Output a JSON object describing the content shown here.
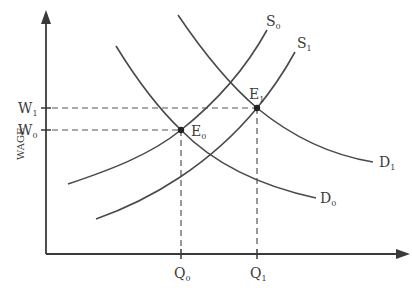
{
  "diagram": {
    "type": "labor-market supply-demand",
    "y_axis_label": "WAGE",
    "wage_levels": [
      {
        "label": "W",
        "sub": "1"
      },
      {
        "label": "W",
        "sub": "0"
      }
    ],
    "quantity_levels": [
      {
        "label": "Q",
        "sub": "0"
      },
      {
        "label": "Q",
        "sub": "1"
      }
    ],
    "curves": {
      "S0": {
        "label": "S",
        "sub": "0"
      },
      "S1": {
        "label": "S",
        "sub": "1"
      },
      "D0": {
        "label": "D",
        "sub": "0"
      },
      "D1": {
        "label": "D",
        "sub": "1"
      }
    },
    "equilibria": {
      "E0": {
        "label": "E",
        "sub": "0"
      },
      "E1": {
        "label": "E",
        "sub": "1"
      }
    },
    "colors": {
      "line": "#4a4a4a",
      "text": "#3a3a3a",
      "background": "#ffffff"
    }
  }
}
